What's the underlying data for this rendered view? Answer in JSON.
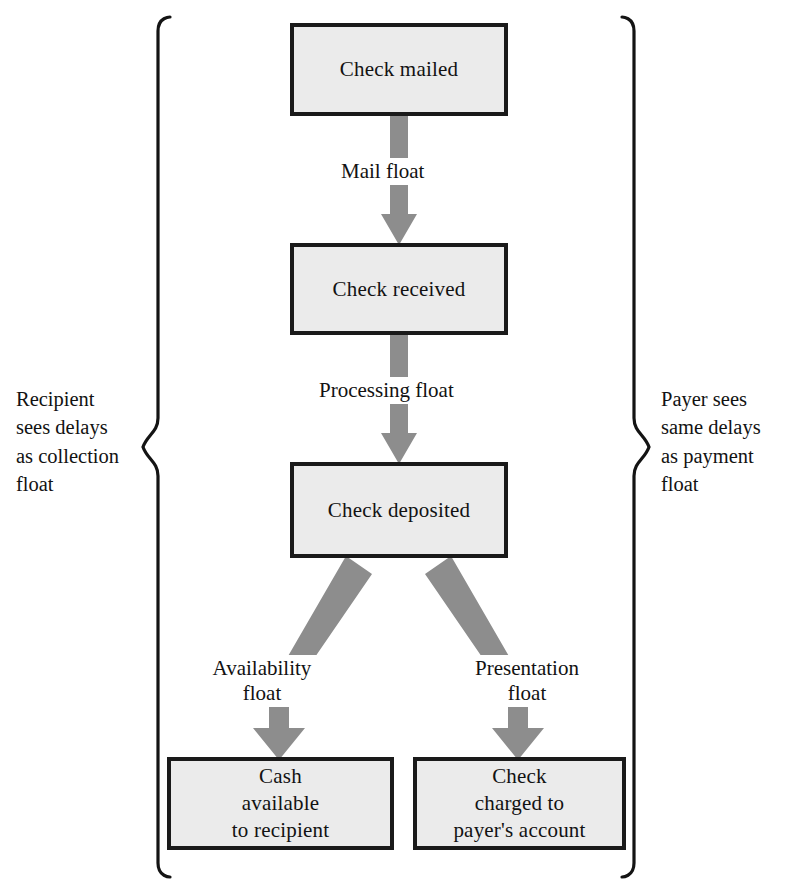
{
  "diagram": {
    "colors": {
      "box_fill": "#ebebeb",
      "box_border": "#1a1a1a",
      "arrow_gray": "#8d8d8d",
      "text": "#121212",
      "background": "#ffffff"
    },
    "nodes": [
      {
        "id": "check-mailed",
        "label": "Check mailed"
      },
      {
        "id": "check-received",
        "label": "Check received"
      },
      {
        "id": "check-deposited",
        "label": "Check deposited"
      },
      {
        "id": "cash-available",
        "label": "Cash\navailable\nto recipient"
      },
      {
        "id": "check-charged",
        "label": "Check\ncharged to\npayer's account"
      }
    ],
    "edges": [
      {
        "id": "mail-float",
        "from": "check-mailed",
        "to": "check-received",
        "label": "Mail float"
      },
      {
        "id": "processing-float",
        "from": "check-received",
        "to": "check-deposited",
        "label": "Processing float"
      },
      {
        "id": "availability-float",
        "from": "check-deposited",
        "to": "cash-available",
        "label": "Availability\nfloat"
      },
      {
        "id": "presentation-float",
        "from": "check-deposited",
        "to": "check-charged",
        "label": "Presentation\nfloat"
      }
    ],
    "annotations": [
      {
        "id": "recipient-note",
        "side": "left",
        "text": "Recipient\nsees delays\nas collection\nfloat"
      },
      {
        "id": "payer-note",
        "side": "right",
        "text": "Payer sees\nsame delays\nas payment\nfloat"
      }
    ]
  }
}
